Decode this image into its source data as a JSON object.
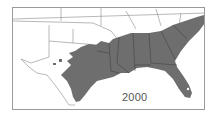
{
  "map": {
    "title": "Distribution range, southeastern United States",
    "year_label": "2000",
    "colors": {
      "range_fill": "#6e6e6e",
      "state_lines": "#8a8a8a",
      "border": "#9a9a9a",
      "background": "#ffffff"
    },
    "regions_shaded": [
      "Texas (east)",
      "Oklahoma (south)",
      "Arkansas (south)",
      "Louisiana",
      "Mississippi",
      "Alabama",
      "Georgia",
      "Florida",
      "South Carolina",
      "North Carolina",
      "Tennessee (south)"
    ]
  }
}
